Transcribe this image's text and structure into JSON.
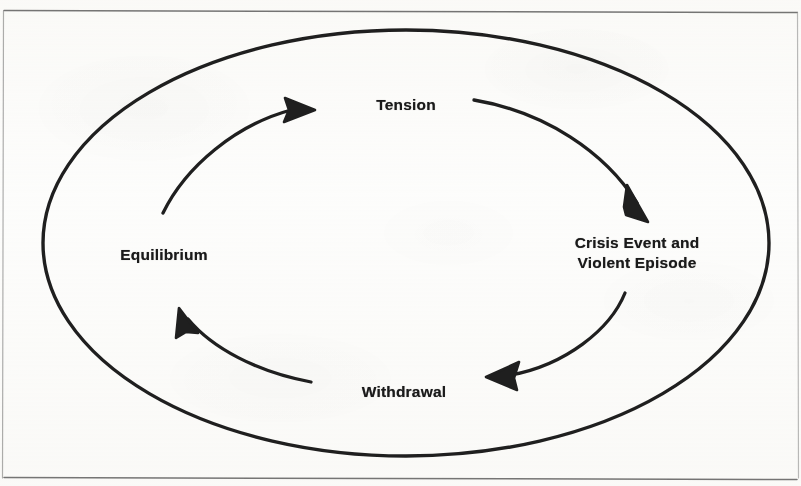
{
  "figure": {
    "type": "cycle-diagram",
    "shape": "ellipse",
    "direction": "clockwise",
    "stage_count": 4,
    "nodes": [
      {
        "id": "tension",
        "label": "Tension",
        "position": "top",
        "x": 406,
        "y": 105
      },
      {
        "id": "crisis",
        "label": "Crisis Event and\nViolent Episode",
        "position": "right",
        "x": 637,
        "y": 253
      },
      {
        "id": "withdrawal",
        "label": "Withdrawal",
        "position": "bottom",
        "x": 404,
        "y": 392
      },
      {
        "id": "equilibrium",
        "label": "Equilibrium",
        "position": "left",
        "x": 164,
        "y": 255
      }
    ],
    "arrows": [
      {
        "id": "tension-to-crisis",
        "from": "tension",
        "to": "crisis",
        "direction": "clockwise"
      },
      {
        "id": "crisis-to-withdrawal",
        "from": "crisis",
        "to": "withdrawal",
        "direction": "clockwise"
      },
      {
        "id": "withdrawal-to-equilibrium",
        "from": "withdrawal",
        "to": "equilibrium",
        "direction": "clockwise"
      },
      {
        "id": "equilibrium-to-tension",
        "from": "equilibrium",
        "to": "tension",
        "direction": "clockwise"
      }
    ],
    "frame": {
      "top_rule": true,
      "bottom_rule": true,
      "left_rule": true,
      "right_rule": true
    },
    "colors": {
      "ink": "#1a1a1a",
      "rule": "#6e6e6e",
      "paper": "#fdfdfc"
    }
  }
}
